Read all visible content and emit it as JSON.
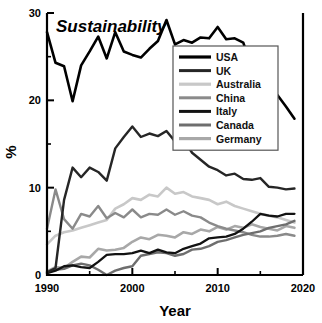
{
  "chart_data": {
    "type": "line",
    "title": "Sustainability",
    "xlabel": "Year",
    "ylabel": "%",
    "xlim": [
      1990,
      2020
    ],
    "ylim": [
      0,
      30
    ],
    "xticks": [
      1990,
      2000,
      2010,
      2020
    ],
    "xticks_minor": [
      1995,
      2005,
      2015
    ],
    "yticks": [
      0,
      10,
      20,
      30
    ],
    "yticks_minor": [
      5,
      15,
      25
    ],
    "grid": false,
    "legend_position": "upper-right-inside",
    "x": [
      1990,
      1991,
      1992,
      1993,
      1994,
      1995,
      1996,
      1997,
      1998,
      1999,
      2000,
      2001,
      2002,
      2003,
      2004,
      2005,
      2006,
      2007,
      2008,
      2009,
      2010,
      2011,
      2012,
      2013,
      2014,
      2015,
      2016,
      2017,
      2018,
      2019
    ],
    "series": [
      {
        "name": "USA",
        "color": "#000000",
        "width": 2.6,
        "values": [
          27.8,
          24.3,
          23.9,
          19.9,
          24.0,
          25.6,
          27.3,
          24.8,
          27.8,
          25.6,
          25.2,
          24.9,
          25.9,
          26.8,
          29.2,
          26.4,
          26.9,
          26.6,
          27.2,
          27.1,
          28.4,
          27.0,
          27.1,
          26.6,
          23.8,
          23.0,
          21.7,
          20.6,
          19.3,
          17.9
        ]
      },
      {
        "name": "UK",
        "color": "#262626",
        "width": 2.4,
        "values": [
          0.3,
          0.8,
          8.6,
          12.3,
          11.2,
          12.3,
          11.8,
          10.8,
          14.5,
          15.8,
          17.0,
          15.8,
          16.2,
          15.9,
          16.5,
          15.3,
          15.5,
          14.0,
          13.2,
          12.4,
          12.0,
          11.4,
          11.6,
          11.0,
          10.9,
          11.1,
          10.1,
          10.0,
          9.8,
          9.9
        ]
      },
      {
        "name": "Australia",
        "color": "#c8c8c8",
        "width": 2.6,
        "values": [
          3.5,
          4.5,
          4.9,
          5.1,
          5.4,
          5.7,
          6.0,
          6.3,
          7.6,
          8.1,
          8.8,
          8.6,
          9.2,
          9.0,
          10.0,
          9.3,
          9.5,
          9.0,
          8.8,
          8.6,
          8.1,
          8.4,
          7.9,
          7.6,
          7.3,
          7.0,
          6.8,
          6.6,
          6.3,
          6.0
        ]
      },
      {
        "name": "China",
        "color": "#8a8a8a",
        "width": 2.4,
        "values": [
          5.3,
          9.8,
          6.4,
          5.3,
          7.0,
          6.7,
          7.9,
          6.5,
          7.1,
          6.6,
          7.5,
          6.6,
          7.0,
          6.9,
          7.5,
          6.9,
          7.3,
          6.8,
          6.6,
          6.0,
          5.6,
          5.3,
          5.1,
          4.9,
          4.6,
          4.4,
          4.4,
          4.5,
          4.7,
          4.5
        ]
      },
      {
        "name": "Italy",
        "color": "#121212",
        "width": 2.3,
        "values": [
          0.2,
          0.5,
          1.0,
          1.1,
          0.9,
          0.8,
          1.5,
          2.3,
          2.4,
          2.4,
          2.5,
          2.8,
          2.5,
          2.9,
          2.6,
          2.5,
          3.0,
          3.3,
          3.6,
          4.2,
          4.3,
          4.4,
          4.7,
          5.3,
          6.1,
          7.0,
          6.8,
          6.7,
          7.0,
          7.0
        ]
      },
      {
        "name": "Canada",
        "color": "#6e6e6e",
        "width": 2.4,
        "values": [
          0.2,
          0.6,
          0.7,
          1.1,
          1.3,
          1.1,
          0.6,
          0.0,
          0.5,
          0.8,
          1.0,
          2.2,
          2.4,
          2.6,
          2.5,
          2.2,
          2.4,
          2.9,
          3.0,
          3.3,
          3.8,
          4.0,
          4.3,
          4.6,
          4.8,
          5.0,
          5.4,
          5.6,
          5.8,
          6.2
        ]
      },
      {
        "name": "Germany",
        "color": "#a8a8a8",
        "width": 2.6,
        "values": [
          0.4,
          0.9,
          0.8,
          1.5,
          2.1,
          2.0,
          3.0,
          2.8,
          2.9,
          3.1,
          3.8,
          4.3,
          4.1,
          4.6,
          4.5,
          4.3,
          4.9,
          4.7,
          5.2,
          5.0,
          5.5,
          5.2,
          5.6,
          5.4,
          5.8,
          5.5,
          5.3,
          5.1,
          5.6,
          5.4
        ]
      }
    ]
  },
  "legend": {
    "items": [
      {
        "label": "USA"
      },
      {
        "label": "UK"
      },
      {
        "label": "Australia"
      },
      {
        "label": "China"
      },
      {
        "label": "Italy"
      },
      {
        "label": "Canada"
      },
      {
        "label": "Germany"
      }
    ]
  }
}
